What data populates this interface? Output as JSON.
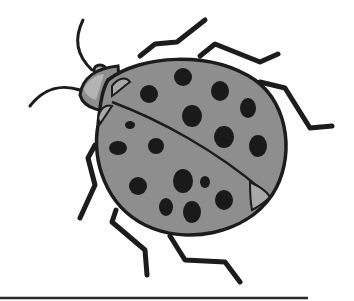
{
  "image": {
    "subject": "ladybug illustration",
    "style": "grayscale line drawing",
    "colors": {
      "background": "#ffffff",
      "outline": "#1c1c1c",
      "shell": "#8e8e8e",
      "shell_light": "#a8a8a8",
      "spots": "#1a1a1a",
      "baseline": "#2a2a2a"
    },
    "spots": [
      {
        "cx": 183,
        "cy": 77,
        "rx": 9,
        "ry": 9
      },
      {
        "cx": 149,
        "cy": 94,
        "rx": 9,
        "ry": 9
      },
      {
        "cx": 220,
        "cy": 91,
        "rx": 9,
        "ry": 10
      },
      {
        "cx": 248,
        "cy": 108,
        "rx": 8,
        "ry": 10
      },
      {
        "cx": 192,
        "cy": 116,
        "rx": 10,
        "ry": 11
      },
      {
        "cx": 224,
        "cy": 137,
        "rx": 10,
        "ry": 11
      },
      {
        "cx": 258,
        "cy": 146,
        "rx": 9,
        "ry": 11
      },
      {
        "cx": 130,
        "cy": 125,
        "rx": 5,
        "ry": 4
      },
      {
        "cx": 118,
        "cy": 148,
        "rx": 9,
        "ry": 7
      },
      {
        "cx": 156,
        "cy": 146,
        "rx": 8,
        "ry": 8
      },
      {
        "cx": 138,
        "cy": 186,
        "rx": 9,
        "ry": 9
      },
      {
        "cx": 183,
        "cy": 181,
        "rx": 10,
        "ry": 12
      },
      {
        "cx": 205,
        "cy": 182,
        "rx": 5,
        "ry": 6
      },
      {
        "cx": 166,
        "cy": 207,
        "rx": 7,
        "ry": 9
      },
      {
        "cx": 192,
        "cy": 212,
        "rx": 9,
        "ry": 11
      },
      {
        "cx": 224,
        "cy": 200,
        "rx": 9,
        "ry": 10
      }
    ],
    "baseline": {
      "x1": 0,
      "x2": 308,
      "y": 298
    }
  }
}
